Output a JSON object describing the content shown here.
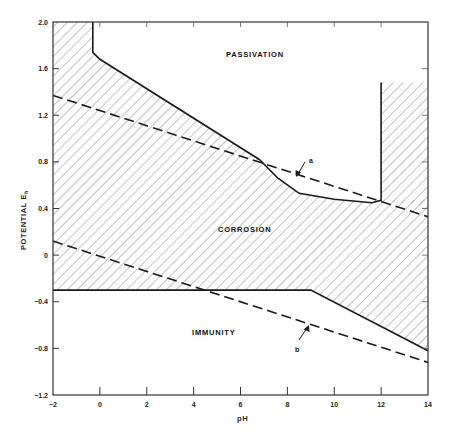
{
  "chart_data": {
    "type": "line",
    "title": "",
    "xlabel": "pH",
    "ylabel": "POTENTIAL E_h",
    "xlim": [
      -2,
      14
    ],
    "ylim": [
      -1.2,
      2.0
    ],
    "x_ticks": [
      "-2",
      "0",
      "2",
      "4",
      "6",
      "8",
      "10",
      "12",
      "14"
    ],
    "y_ticks": [
      "2.0",
      "1.6",
      "1.2",
      "0.8",
      "0.4",
      "0",
      "-0.4",
      "-0.8",
      "-1.2"
    ],
    "grid": false,
    "regions": [
      {
        "name": "PASSIVATION",
        "hatched": false
      },
      {
        "name": "CORROSION",
        "hatched": true
      },
      {
        "name": "IMMUNITY",
        "hatched": false
      }
    ],
    "series": [
      {
        "name": "passivation boundary",
        "style": "solid",
        "points": [
          [
            -0.3,
            2.0
          ],
          [
            -0.3,
            1.74
          ],
          [
            0.0,
            1.68
          ],
          [
            6.8,
            0.82
          ],
          [
            7.6,
            0.66
          ],
          [
            8.5,
            0.53
          ],
          [
            10.0,
            0.48
          ],
          [
            11.6,
            0.45
          ],
          [
            12.0,
            0.47
          ],
          [
            12.0,
            1.48
          ]
        ]
      },
      {
        "name": "right corrosion zone top",
        "style": "none",
        "points": [
          [
            12.0,
            1.48
          ],
          [
            14.0,
            1.48
          ]
        ]
      },
      {
        "name": "immunity boundary",
        "style": "solid",
        "points": [
          [
            -2.0,
            -0.3
          ],
          [
            9.0,
            -0.3
          ],
          [
            14.0,
            -0.82
          ]
        ]
      },
      {
        "name": "a",
        "style": "dashed",
        "points": [
          [
            -2.0,
            1.37
          ],
          [
            14.0,
            0.33
          ]
        ]
      },
      {
        "name": "b",
        "style": "dashed",
        "points": [
          [
            -2.0,
            0.12
          ],
          [
            14.0,
            -0.92
          ]
        ]
      }
    ],
    "annotations": [
      {
        "text": "a",
        "points_to": [
          8.7,
          0.62
        ]
      },
      {
        "text": "b",
        "points_to": [
          9.1,
          -0.56
        ]
      }
    ]
  },
  "labels": {
    "passivation": "PASSIVATION",
    "corrosion": "CORROSION",
    "immunity": "IMMUNITY",
    "line_a": "a",
    "line_b": "b",
    "xlabel": "pH",
    "ylabel_main": "POTENTIAL E",
    "ylabel_sub": "h"
  },
  "ticks": {
    "x": [
      "-2",
      "0",
      "2",
      "4",
      "6",
      "8",
      "10",
      "12",
      "14"
    ],
    "y": [
      "2.0",
      "1.6",
      "1.2",
      "0.8",
      "0.4",
      "0",
      "-0.4",
      "-0.8",
      "-1.2"
    ]
  },
  "colors": {
    "line": "#1a1a1a",
    "hatch": "#6a6a6a",
    "background": "#ffffff"
  }
}
